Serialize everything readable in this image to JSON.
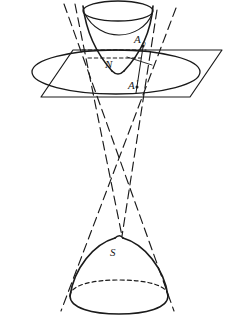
{
  "figure": {
    "background_color": "#ffffff",
    "stroke_color": "#1a1a1a",
    "labels": [
      {
        "id": "label-a-sub",
        "text": "A",
        "subscript": "0",
        "x": 134,
        "y": 43
      },
      {
        "id": "label-n",
        "text": "N",
        "x": 105,
        "y": 68
      },
      {
        "id": "label-a-prime",
        "text": "A",
        "prime": "'",
        "x": 128,
        "y": 89
      },
      {
        "id": "label-s",
        "text": "S",
        "x": 110,
        "y": 256
      }
    ],
    "parts": {
      "upper_sheet": "upper hyperboloid bowl",
      "lower_sheet": "lower hyperboloid dome",
      "cutting_plane": "horizontal plane parallelogram",
      "section_ellipse": "ellipse of intersection in plane",
      "asymptotic_cone": "dashed generator lines of asymptotic cone"
    }
  }
}
